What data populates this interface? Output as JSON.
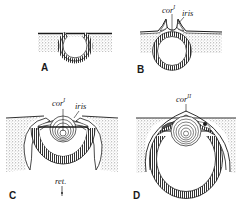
{
  "figure": {
    "colors": {
      "ink": "#1a1a1a",
      "stipple": "#9a9a9a",
      "background": "#ffffff"
    },
    "panels": [
      {
        "id": "A",
        "letter": "A",
        "labels": []
      },
      {
        "id": "B",
        "letter": "B",
        "labels": [
          {
            "text": "cor",
            "sup": "I"
          },
          {
            "text": "iris",
            "sup": ""
          }
        ]
      },
      {
        "id": "C",
        "letter": "C",
        "labels": [
          {
            "text": "cor",
            "sup": "I"
          },
          {
            "text": "iris",
            "sup": ""
          },
          {
            "text": "ret.",
            "sup": ""
          }
        ]
      },
      {
        "id": "D",
        "letter": "D",
        "labels": [
          {
            "text": "cor",
            "sup": "II"
          }
        ]
      }
    ]
  }
}
